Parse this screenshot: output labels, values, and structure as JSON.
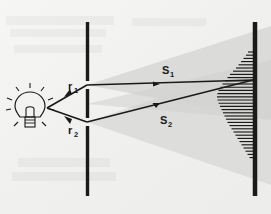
{
  "figure": {
    "background_color": "#f2f2f1",
    "ink_color": "#1a1a1a",
    "beam_color": "#d8d8d6"
  },
  "source": {
    "name": "light-bulb",
    "label": "",
    "center_x": 30,
    "center_y": 107,
    "ray_count": 8
  },
  "barrier_slits": {
    "name": "double-slit-barrier",
    "x": 87,
    "top": 22,
    "bottom": 196,
    "thickness": 3.4,
    "color": "#1a1a1a",
    "slits": [
      {
        "label": "slit-1",
        "y": 85
      },
      {
        "label": "slit-2",
        "y": 122
      }
    ]
  },
  "screen": {
    "name": "observation-screen",
    "x": 255,
    "top": 22,
    "bottom": 196,
    "thickness": 4.5,
    "color": "#1a1a1a"
  },
  "rays": [
    {
      "name": "ray-r1",
      "label": "r",
      "subscript": "1",
      "label_x": 68,
      "label_y": 90,
      "from_x": 47,
      "from_y": 108,
      "to_x": 87,
      "to_y": 85
    },
    {
      "name": "ray-r2",
      "label": "r",
      "subscript": "2",
      "label_x": 68,
      "label_y": 134,
      "from_x": 47,
      "from_y": 108,
      "to_x": 87,
      "to_y": 122
    },
    {
      "name": "ray-s1",
      "label": "S",
      "subscript": "1",
      "label_x": 162,
      "label_y": 74,
      "from_x": 87,
      "from_y": 85,
      "to_x": 253,
      "to_y": 80
    },
    {
      "name": "ray-s2",
      "label": "S",
      "subscript": "2",
      "label_x": 160,
      "label_y": 124,
      "from_x": 87,
      "from_y": 122,
      "to_x": 253,
      "to_y": 80
    }
  ],
  "light_cones": [
    {
      "name": "cone-upper",
      "apex_x": 87,
      "apex_y": 85,
      "edge_top_y": 26,
      "edge_bottom_y": 120
    },
    {
      "name": "cone-lower",
      "apex_x": 87,
      "apex_y": 122,
      "edge_top_y": 60,
      "edge_bottom_y": 185
    }
  ],
  "fringe_pattern": {
    "name": "interference-fringes",
    "screen_x": 253,
    "center_y": 80,
    "count": 34,
    "spacing": 3.2,
    "max_length": 36,
    "color": "#1a1a1a"
  }
}
